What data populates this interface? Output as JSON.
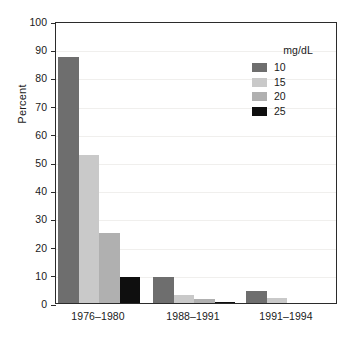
{
  "chart_data": {
    "type": "bar",
    "title": "",
    "subtitle": "",
    "xlabel": "",
    "ylabel": "Percent",
    "ylim": [
      0,
      100
    ],
    "ytick_step": 10,
    "ytick_labels": [
      "0",
      "10",
      "20",
      "30",
      "40",
      "50",
      "60",
      "70",
      "80",
      "90",
      "100"
    ],
    "grid": false,
    "legend_position": "top-right",
    "legend_title": "mg/dL",
    "categories": [
      "1976–1980",
      "1988–1991",
      "1991–1994"
    ],
    "series": [
      {
        "name": "10",
        "color": "#6e6e6e",
        "values": [
          87.2,
          9.3,
          4.2
        ]
      },
      {
        "name": "15",
        "color": "#c9c9c9",
        "values": [
          52.6,
          3.0,
          1.8
        ]
      },
      {
        "name": "20",
        "color": "#b0b0b0",
        "values": [
          25.0,
          1.3,
          0.0
        ]
      },
      {
        "name": "25",
        "color": "#0f0f0f",
        "values": [
          9.2,
          0.5,
          0.0
        ]
      }
    ]
  },
  "legend": {
    "title": "mg/dL",
    "entries": [
      {
        "label": "10",
        "color": "#6e6e6e"
      },
      {
        "label": "15",
        "color": "#c9c9c9"
      },
      {
        "label": "20",
        "color": "#b0b0b0"
      },
      {
        "label": "25",
        "color": "#0f0f0f"
      }
    ]
  },
  "axes": {
    "y_title": "Percent",
    "y_ticks": [
      "100",
      "90",
      "80",
      "70",
      "60",
      "50",
      "40",
      "30",
      "20",
      "10",
      "0"
    ],
    "x_ticks": [
      "1976–1980",
      "1988–1991",
      "1991–1994"
    ]
  }
}
